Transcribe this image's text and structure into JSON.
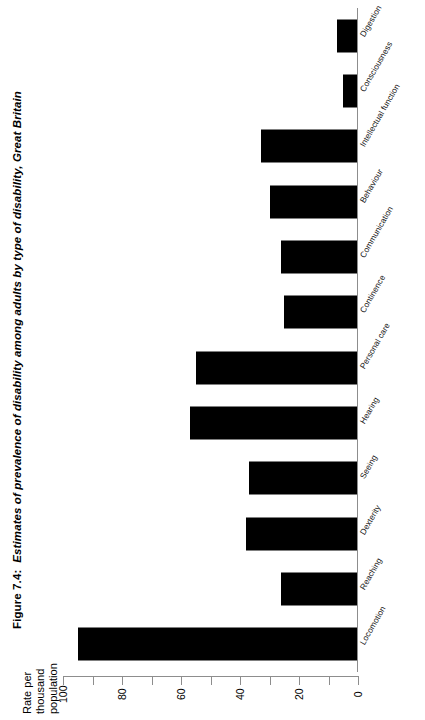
{
  "caption": {
    "figure_number": "Figure 7.4:",
    "title": "Estimates of prevalence of disability among adults by type of disability, Great Britain"
  },
  "axis_title": {
    "line1": "Rate per",
    "line2": "thousand",
    "line3": "population"
  },
  "chart_data": {
    "type": "bar",
    "orientation": "horizontal",
    "title": "Estimates of prevalence of disability among adults by type of disability, Great Britain",
    "xlabel": "Rate per thousand population",
    "ylabel": "",
    "categories": [
      "Digestion",
      "Consciousness",
      "Intellectual function",
      "Behaviour",
      "Communication",
      "Continence",
      "Personal care",
      "Hearing",
      "Seeing",
      "Dexterity",
      "Reaching",
      "Locomotion"
    ],
    "values": [
      7,
      5,
      33,
      30,
      26,
      25,
      55,
      57,
      37,
      38,
      26,
      95
    ],
    "xlim": [
      0,
      100
    ],
    "axis_direction": "reversed",
    "tick_labels": [
      "100",
      "80",
      "60",
      "40",
      "20",
      "0"
    ],
    "tick_values": [
      100,
      80,
      60,
      40,
      20,
      0
    ],
    "minor_tick_values": [
      90,
      70,
      50,
      30,
      10
    ],
    "grid": false,
    "bar_color": "#000000",
    "axis_color": "#8d8d8d"
  }
}
